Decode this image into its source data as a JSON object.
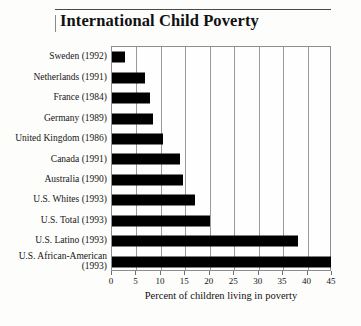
{
  "title": "International Child Poverty",
  "chart_data": {
    "type": "bar",
    "orientation": "horizontal",
    "title": "International Child Poverty",
    "xlabel": "Percent of children living in poverty",
    "ylabel": "",
    "xlim": [
      0,
      45
    ],
    "xticks": [
      0,
      5,
      10,
      15,
      20,
      25,
      30,
      35,
      40,
      45
    ],
    "grid": true,
    "legend": "none",
    "bar_color": "#000000",
    "categories": [
      "Sweden (1992)",
      "Netherlands (1991)",
      "France (1984)",
      "Germany (1989)",
      "United Kingdom (1986)",
      "Canada (1991)",
      "Australia (1990)",
      "U.S. Whites (1993)",
      "U.S. Total (1993)",
      "U.S. Latino (1993)",
      "U.S. African-American\n(1993)"
    ],
    "values": [
      2.7,
      6.7,
      7.8,
      8.4,
      10.5,
      14.0,
      14.5,
      17.0,
      20.0,
      38.0,
      44.8
    ]
  }
}
